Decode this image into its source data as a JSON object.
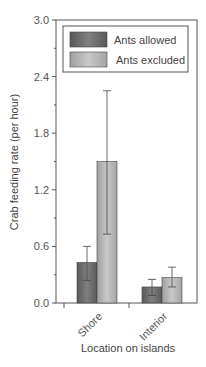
{
  "chart_data": {
    "type": "bar",
    "title": "",
    "xlabel": "Location on islands",
    "ylabel": "Crab feeding rate (per hour)",
    "ylim": [
      0,
      3.0
    ],
    "yticks": [
      "0.0",
      "0.6",
      "1.2",
      "1.8",
      "2.4",
      "3.0"
    ],
    "grid": false,
    "legend_position": "top-inside",
    "categories": [
      "Shore",
      "Interior"
    ],
    "series": [
      {
        "name": "Ants allowed",
        "color": "#6e6e6e",
        "values": [
          0.43,
          0.17
        ],
        "err_low": [
          0.24,
          0.08
        ],
        "err_high": [
          0.6,
          0.25
        ]
      },
      {
        "name": "Ants excluded",
        "color": "#b4b4b4",
        "values": [
          1.5,
          0.27
        ],
        "err_low": [
          0.73,
          0.17
        ],
        "err_high": [
          2.25,
          0.38
        ]
      }
    ]
  }
}
